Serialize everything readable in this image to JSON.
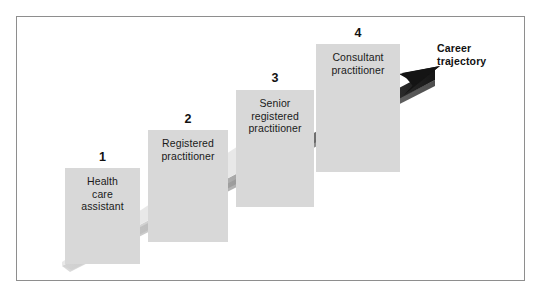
{
  "figure": {
    "background_color": "#ffffff",
    "frame_border_color": "#8e8e8e",
    "box_fill_color": "#d8d8d8",
    "arrow_color_start": "#d9d9d9",
    "arrow_color_end": "#1c1c1c"
  },
  "steps": [
    {
      "number": "1",
      "label": "Health\ncare\nassistant",
      "x": 65,
      "y": 168,
      "width": 75,
      "height": 96,
      "number_x": 65,
      "number_y": 150
    },
    {
      "number": "2",
      "label": "Registered\npractitioner",
      "x": 148,
      "y": 130,
      "width": 80,
      "height": 112,
      "number_x": 148,
      "number_y": 112
    },
    {
      "number": "3",
      "label": "Senior\nregistered\npractitioner",
      "x": 236,
      "y": 90,
      "width": 78,
      "height": 117,
      "number_x": 236,
      "number_y": 71
    },
    {
      "number": "4",
      "label": "Consultant\npractitioner",
      "x": 316,
      "y": 44,
      "width": 84,
      "height": 128,
      "number_x": 316,
      "number_y": 26
    }
  ],
  "arrow": {
    "label": "Career\ntrajectory",
    "label_x": 437,
    "label_y": 42,
    "tip_x": 431,
    "tip_y": 70,
    "tail_x": 62,
    "tail_y": 266
  }
}
